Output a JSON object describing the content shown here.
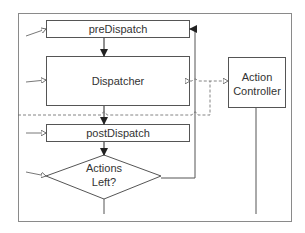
{
  "diagram": {
    "nodes": {
      "pre_dispatch": "preDispatch",
      "dispatcher": "Dispatcher",
      "post_dispatch": "postDispatch",
      "decision_line1": "Actions",
      "decision_line2": "Left?",
      "controller_line1": "Action",
      "controller_line2": "Controller"
    },
    "colors": {
      "line": "#555555",
      "frame": "#888888",
      "text": "#333333"
    }
  }
}
